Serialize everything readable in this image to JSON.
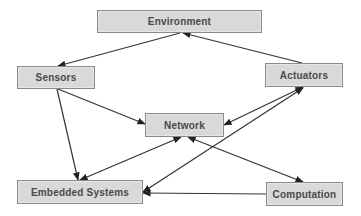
{
  "diagram": {
    "type": "directed-graph",
    "nodes": [
      {
        "id": "environment",
        "label": "Environment",
        "x": 97,
        "y": 10,
        "w": 165,
        "h": 23
      },
      {
        "id": "sensors",
        "label": "Sensors",
        "x": 17,
        "y": 66,
        "w": 78,
        "h": 23
      },
      {
        "id": "actuators",
        "label": "Actuators",
        "x": 265,
        "y": 63,
        "w": 78,
        "h": 24
      },
      {
        "id": "network",
        "label": "Network",
        "x": 145,
        "y": 113,
        "w": 79,
        "h": 24
      },
      {
        "id": "embedded",
        "label": "Embedded Systems",
        "x": 17,
        "y": 180,
        "w": 126,
        "h": 24
      },
      {
        "id": "computation",
        "label": "Computation",
        "x": 266,
        "y": 182,
        "w": 77,
        "h": 24
      }
    ],
    "edges": [
      {
        "from": "environment",
        "to": "sensors",
        "x1": 180,
        "y1": 33,
        "x2": 58,
        "y2": 66,
        "start_arrow": false,
        "end_arrow": true
      },
      {
        "from": "actuators",
        "to": "environment",
        "x1": 302,
        "y1": 63,
        "x2": 183,
        "y2": 33,
        "start_arrow": false,
        "end_arrow": true
      },
      {
        "from": "sensors",
        "to": "network",
        "x1": 58,
        "y1": 89,
        "x2": 145,
        "y2": 124,
        "start_arrow": false,
        "end_arrow": true
      },
      {
        "from": "sensors",
        "to": "embedded",
        "x1": 57,
        "y1": 89,
        "x2": 78,
        "y2": 180,
        "start_arrow": false,
        "end_arrow": true
      },
      {
        "from": "actuators",
        "to": "network",
        "x1": 303,
        "y1": 87,
        "x2": 224,
        "y2": 125,
        "start_arrow": true,
        "end_arrow": true
      },
      {
        "from": "actuators",
        "to": "embedded",
        "x1": 303,
        "y1": 88,
        "x2": 143,
        "y2": 192,
        "start_arrow": true,
        "end_arrow": true
      },
      {
        "from": "network",
        "to": "embedded",
        "x1": 181,
        "y1": 137,
        "x2": 80,
        "y2": 180,
        "start_arrow": true,
        "end_arrow": true
      },
      {
        "from": "network",
        "to": "computation",
        "x1": 188,
        "y1": 137,
        "x2": 303,
        "y2": 182,
        "start_arrow": true,
        "end_arrow": true
      },
      {
        "from": "computation",
        "to": "embedded",
        "x1": 266,
        "y1": 194,
        "x2": 143,
        "y2": 193,
        "start_arrow": false,
        "end_arrow": true
      }
    ],
    "colors": {
      "node_fill": "#d9d9d9",
      "node_border": "#8a8a8a",
      "label": "#4a4a4a",
      "edge": "#333333"
    }
  }
}
